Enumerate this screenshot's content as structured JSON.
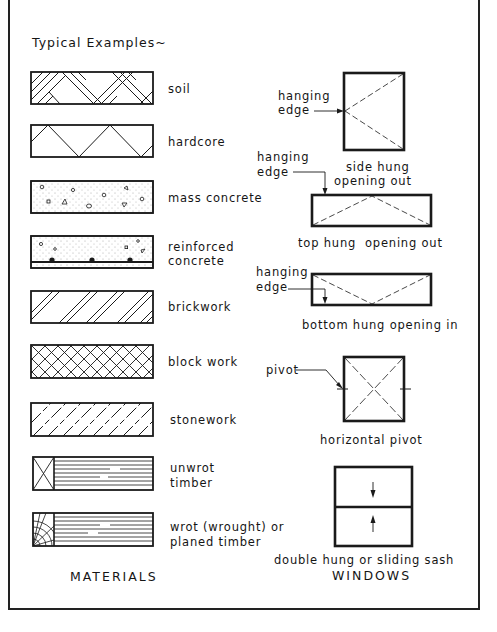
{
  "heading": "Typical Examples~",
  "materials": {
    "title": "MATERIALS",
    "items": [
      {
        "id": "soil",
        "label": "soil"
      },
      {
        "id": "hardcore",
        "label": "hardcore"
      },
      {
        "id": "mass-concrete",
        "label": "mass concrete"
      },
      {
        "id": "reinforced-concrete",
        "label_line1": "reinforced",
        "label_line2": "concrete"
      },
      {
        "id": "brickwork",
        "label": "brickwork"
      },
      {
        "id": "blockwork",
        "label": "block work"
      },
      {
        "id": "stonework",
        "label": "stonework"
      },
      {
        "id": "unwrot-timber",
        "label_line1": "unwrot",
        "label_line2": "timber"
      },
      {
        "id": "wrot-timber",
        "label_line1": "wrot (wrought) or",
        "label_line2": "planed timber"
      }
    ]
  },
  "windows": {
    "title": "WINDOWS",
    "items": [
      {
        "id": "side-hung",
        "label_line1": "side hung",
        "label_line2": "opening out",
        "annotation_line1": "hanging",
        "annotation_line2": "edge"
      },
      {
        "id": "top-hung",
        "label": "top hung  opening out",
        "annotation_line1": "hanging",
        "annotation_line2": "edge"
      },
      {
        "id": "bottom-hung",
        "label": "bottom hung opening in",
        "annotation_line1": "hanging",
        "annotation_line2": "edge"
      },
      {
        "id": "horizontal-pivot",
        "label": "horizontal pivot",
        "annotation": "pivot"
      },
      {
        "id": "double-hung",
        "label": "double hung or sliding sash"
      }
    ]
  },
  "colors": {
    "ink": "#151515",
    "paper": "#ffffff"
  }
}
